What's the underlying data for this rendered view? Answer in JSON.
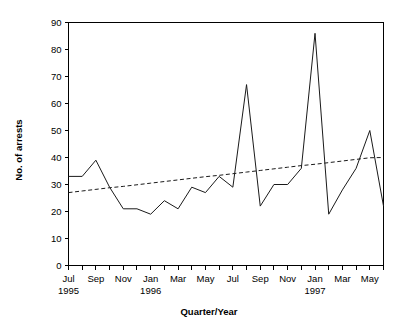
{
  "chart_data": {
    "type": "line",
    "title": "",
    "xlabel": "Quarter/Year",
    "ylabel": "No. of arrests",
    "ylim": [
      0,
      90
    ],
    "ytick_step": 10,
    "yticks": [
      0,
      10,
      20,
      30,
      40,
      50,
      60,
      70,
      80,
      90
    ],
    "grid": false,
    "legend": "none",
    "x": [
      "Jul 1995",
      "Aug 1995",
      "Sep 1995",
      "Oct 1995",
      "Nov 1995",
      "Dec 1995",
      "Jan 1996",
      "Feb 1996",
      "Mar 1996",
      "Apr 1996",
      "May 1996",
      "Jun 1996",
      "Jul 1996",
      "Aug 1996",
      "Sep 1996",
      "Oct 1996",
      "Nov 1996",
      "Dec 1996",
      "Jan 1997",
      "Feb 1997",
      "Mar 1997",
      "Apr 1997",
      "May 1997",
      "Jun 1997"
    ],
    "xtick_labels": [
      "Jul",
      "",
      "Sep",
      "",
      "Nov",
      "",
      "Jan",
      "",
      "Mar",
      "",
      "May",
      "",
      "Jul",
      "",
      "Sep",
      "",
      "Nov",
      "",
      "Jan",
      "",
      "Mar",
      "",
      "May",
      ""
    ],
    "year_labels": [
      {
        "index": 0,
        "text": "1995"
      },
      {
        "index": 6,
        "text": "1996"
      },
      {
        "index": 18,
        "text": "1997"
      }
    ],
    "series": [
      {
        "name": "No. of arrests",
        "style": "solid",
        "values": [
          33,
          33,
          39,
          29,
          21,
          21,
          19,
          24,
          21,
          29,
          27,
          33,
          29,
          67,
          22,
          30,
          30,
          36,
          86,
          19,
          28,
          36,
          50,
          22
        ]
      },
      {
        "name": "Linear trend",
        "style": "dashed",
        "values": [
          27,
          27.6,
          28.2,
          28.8,
          29.3,
          29.9,
          30.5,
          31.1,
          31.7,
          32.3,
          32.9,
          33.4,
          34.0,
          34.6,
          35.2,
          35.8,
          36.4,
          37.0,
          37.5,
          38.1,
          38.7,
          39.3,
          39.9,
          40.0
        ]
      }
    ]
  }
}
